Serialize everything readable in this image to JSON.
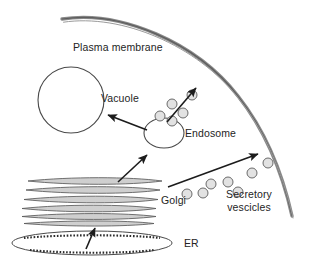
{
  "diagram": {
    "background_color": "#ffffff",
    "stroke_color": "#3c3c3c",
    "membrane_color": "#707070",
    "label_color": "#242424",
    "vesicle_fill": "#e2e2e2",
    "labels": {
      "plasma_membrane": "Plasma membrane",
      "vacuole": "Vacuole",
      "endosome": "Endosome",
      "golgi": "Golgi",
      "secretory_line1": "Secretory",
      "secretory_line2": "vescicles",
      "er": "ER"
    },
    "structures": [
      {
        "name": "plasma-membrane",
        "type": "curve",
        "description": "Thick double-stroked arc forming the cell boundary at top-right"
      },
      {
        "name": "vacuole",
        "type": "circle",
        "cx": 71,
        "cy": 100,
        "r": 33
      },
      {
        "name": "endosome",
        "type": "ellipse",
        "cx": 164,
        "cy": 133,
        "rx": 20,
        "ry": 15
      },
      {
        "name": "golgi",
        "type": "stack",
        "cisternae_count": 6
      },
      {
        "name": "er",
        "type": "ellipse-with-ribosomes",
        "cx": 92,
        "cy": 243,
        "rx": 80,
        "ry": 12
      }
    ],
    "arrows": [
      {
        "name": "arrow-er-to-golgi",
        "from": "ER",
        "to": "Golgi"
      },
      {
        "name": "arrow-golgi-to-endosome",
        "from": "Golgi",
        "to": "Endosome"
      },
      {
        "name": "arrow-endosome-to-vacuole",
        "from": "Endosome",
        "to": "Vacuole"
      },
      {
        "name": "arrow-endosome-to-membrane",
        "from": "Endosome",
        "to": "Plasma membrane"
      },
      {
        "name": "arrow-golgi-to-membrane",
        "from": "Golgi",
        "to": "Plasma membrane"
      }
    ],
    "endosome_vesicles": [
      {
        "cx": 172,
        "cy": 104,
        "r": 5
      },
      {
        "cx": 192,
        "cy": 95,
        "r": 5
      },
      {
        "cx": 183,
        "cy": 113,
        "r": 5
      },
      {
        "cx": 172,
        "cy": 121,
        "r": 5
      },
      {
        "cx": 160,
        "cy": 116,
        "r": 5
      }
    ],
    "secretory_vesicles": [
      {
        "cx": 187,
        "cy": 194,
        "r": 5
      },
      {
        "cx": 203,
        "cy": 193,
        "r": 5
      },
      {
        "cx": 211,
        "cy": 184,
        "r": 5
      },
      {
        "cx": 228,
        "cy": 182,
        "r": 5
      },
      {
        "cx": 238,
        "cy": 192,
        "r": 5
      },
      {
        "cx": 252,
        "cy": 173,
        "r": 5
      },
      {
        "cx": 268,
        "cy": 163,
        "r": 5
      }
    ]
  }
}
